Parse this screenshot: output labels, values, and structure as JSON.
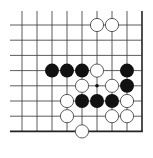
{
  "board": {
    "type": "go-diagram-fragment",
    "columns": 9,
    "rows": 8,
    "open_edges": [
      "top",
      "left"
    ],
    "closed_edges": [
      "right",
      "bottom"
    ],
    "origin": {
      "x": 22,
      "y": 25
    },
    "spacing": {
      "x": 15,
      "y": 15.2
    },
    "line_extend": {
      "top": 11,
      "left": 10
    },
    "stone_radius": 7,
    "colors": {
      "line": "#333333",
      "edge": "#222222",
      "black": "#111111",
      "white": "#ffffff",
      "white_outline": "#333333",
      "background": "#ffffff"
    },
    "star_points": [
      {
        "col": 5,
        "row": 4
      }
    ],
    "stones": [
      {
        "col": 5,
        "row": 0,
        "color": "white"
      },
      {
        "col": 6,
        "row": 0,
        "color": "white"
      },
      {
        "col": 2,
        "row": 3,
        "color": "black"
      },
      {
        "col": 3,
        "row": 3,
        "color": "black"
      },
      {
        "col": 4,
        "row": 3,
        "color": "black"
      },
      {
        "col": 5,
        "row": 3,
        "color": "white"
      },
      {
        "col": 7,
        "row": 3,
        "color": "black"
      },
      {
        "col": 4,
        "row": 4,
        "color": "white"
      },
      {
        "col": 6,
        "row": 4,
        "color": "white"
      },
      {
        "col": 7,
        "row": 4,
        "color": "black"
      },
      {
        "col": 3,
        "row": 5,
        "color": "white"
      },
      {
        "col": 4,
        "row": 5,
        "color": "black"
      },
      {
        "col": 5,
        "row": 5,
        "color": "black"
      },
      {
        "col": 6,
        "row": 5,
        "color": "black"
      },
      {
        "col": 7,
        "row": 5,
        "color": "white"
      },
      {
        "col": 3,
        "row": 6,
        "color": "white"
      },
      {
        "col": 6,
        "row": 6,
        "color": "white"
      },
      {
        "col": 7,
        "row": 6,
        "color": "white"
      },
      {
        "col": 4,
        "row": 7,
        "color": "white"
      }
    ]
  }
}
